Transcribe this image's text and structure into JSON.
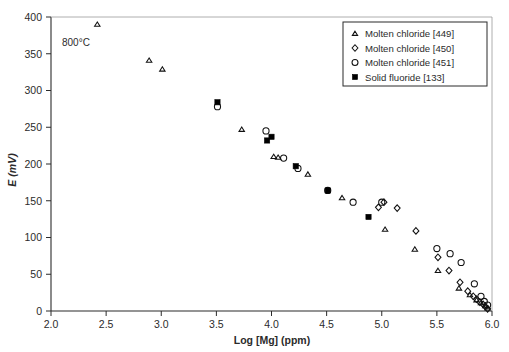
{
  "figure": {
    "background": "#ffffff",
    "annotation": "800°C",
    "marker_color": "#000000"
  },
  "chart_data": {
    "type": "scatter",
    "title": "",
    "subtitle": "",
    "xlabel": "Log [Mg] (ppm)",
    "ylabel": "E (mV)",
    "xlim": [
      2.0,
      6.0
    ],
    "ylim": [
      0,
      400
    ],
    "xticks": [
      "2.0",
      "2.5",
      "3.0",
      "3.5",
      "4.0",
      "4.5",
      "5.0",
      "5.5",
      "6.0"
    ],
    "xtick_values": [
      2.0,
      2.5,
      3.0,
      3.5,
      4.0,
      4.5,
      5.0,
      5.5,
      6.0
    ],
    "yticks": [
      "0",
      "50",
      "100",
      "150",
      "200",
      "250",
      "300",
      "350",
      "400"
    ],
    "ytick_values": [
      0,
      50,
      100,
      150,
      200,
      250,
      300,
      350,
      400
    ],
    "grid": false,
    "legend_position": "top-right",
    "annotations": [
      {
        "text": "800°C",
        "x": 2.18,
        "y": 355
      }
    ],
    "series": [
      {
        "name": "Molten chloride [449]",
        "marker": "triangle-open",
        "color": "#000000",
        "points": [
          [
            2.42,
            390
          ],
          [
            2.89,
            341
          ],
          [
            3.01,
            329
          ],
          [
            3.73,
            247
          ],
          [
            4.02,
            210
          ],
          [
            4.06,
            209
          ],
          [
            4.33,
            186
          ],
          [
            4.64,
            154
          ],
          [
            5.03,
            111
          ],
          [
            5.3,
            84
          ],
          [
            5.51,
            55
          ],
          [
            5.7,
            31
          ],
          [
            5.8,
            22
          ],
          [
            5.86,
            15
          ],
          [
            5.9,
            11
          ],
          [
            5.94,
            7
          ],
          [
            5.96,
            4
          ]
        ]
      },
      {
        "name": "Molten chloride [450]",
        "marker": "diamond-open",
        "color": "#000000",
        "points": [
          [
            4.97,
            141
          ],
          [
            5.02,
            148
          ],
          [
            5.14,
            140
          ],
          [
            5.31,
            109
          ],
          [
            5.51,
            73
          ],
          [
            5.61,
            55
          ],
          [
            5.71,
            39
          ],
          [
            5.78,
            27
          ],
          [
            5.83,
            20
          ],
          [
            5.86,
            16
          ],
          [
            5.89,
            12
          ],
          [
            5.92,
            9
          ],
          [
            5.94,
            6
          ],
          [
            5.96,
            3
          ]
        ]
      },
      {
        "name": "Molten chloride [451]",
        "marker": "circle-open",
        "color": "#000000",
        "points": [
          [
            3.51,
            278
          ],
          [
            3.95,
            245
          ],
          [
            4.11,
            208
          ],
          [
            4.24,
            194
          ],
          [
            4.51,
            164
          ],
          [
            4.74,
            148
          ],
          [
            5.0,
            148
          ],
          [
            5.5,
            85
          ],
          [
            5.62,
            78
          ],
          [
            5.72,
            66
          ],
          [
            5.84,
            37
          ],
          [
            5.9,
            20
          ],
          [
            5.93,
            13
          ],
          [
            5.96,
            8
          ]
        ]
      },
      {
        "name": "Solid fluoride [133]",
        "marker": "square-filled",
        "color": "#000000",
        "points": [
          [
            3.51,
            284
          ],
          [
            3.96,
            232
          ],
          [
            4.0,
            237
          ],
          [
            4.22,
            197
          ],
          [
            4.51,
            164
          ],
          [
            4.88,
            128
          ]
        ]
      }
    ]
  },
  "legend": {
    "entries": [
      {
        "label": "Molten chloride [449]",
        "marker": "triangle-open"
      },
      {
        "label": "Molten chloride [450]",
        "marker": "diamond-open"
      },
      {
        "label": "Molten chloride [451]",
        "marker": "circle-open"
      },
      {
        "label": "Solid fluoride [133]",
        "marker": "square-filled"
      }
    ]
  }
}
